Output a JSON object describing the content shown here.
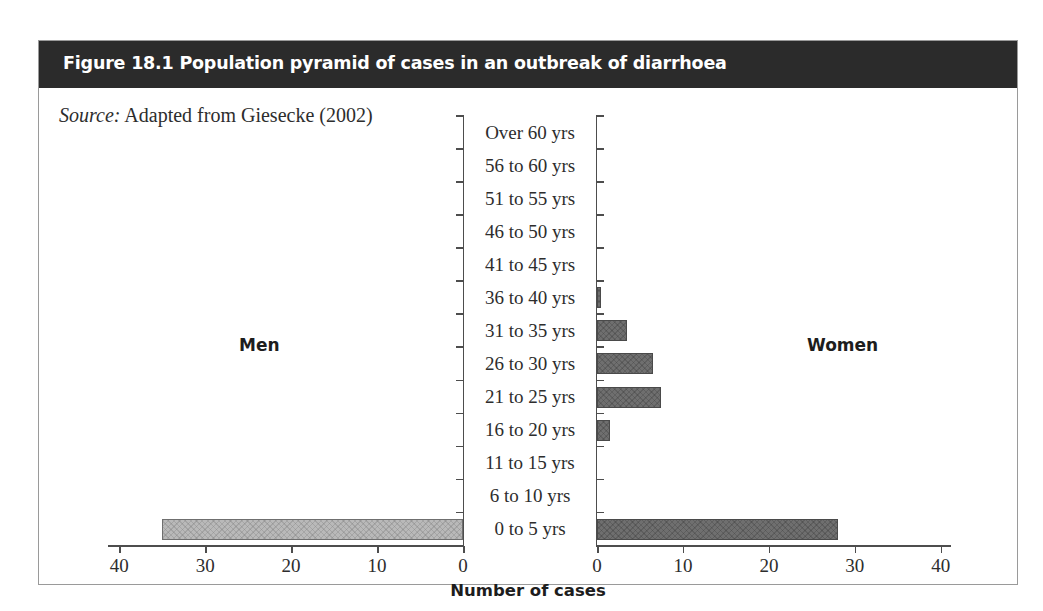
{
  "figure": {
    "title": "Figure 18.1 Population pyramid of cases in an outbreak of diarrhoea",
    "source_label": "Source:",
    "source_text": " Adapted from Giesecke (2002)",
    "header_color": "#2b2b2b",
    "border_color": "#9a9a9a"
  },
  "chart_data": {
    "type": "bar",
    "title": "Figure 18.1 Population pyramid of cases in an outbreak of diarrhoea",
    "subtitle": "Source: Adapted from Giesecke (2002)",
    "orientation": "horizontal-pyramid",
    "xlabel": "Number of cases",
    "ylabel": "",
    "xlim": [
      0,
      40
    ],
    "grid": false,
    "legend_position": "inline-panel",
    "left_series_label": "Men",
    "right_series_label": "Women",
    "left_color": "#b9b9b9",
    "right_color": "#6f6f6f",
    "categories": [
      "Over 60 yrs",
      "56 to 60 yrs",
      "51 to 55 yrs",
      "46 to 50 yrs",
      "41 to 45 yrs",
      "36 to 40 yrs",
      "31 to 35 yrs",
      "26 to 30 yrs",
      "21 to 25 yrs",
      "16 to 20 yrs",
      "11 to 15 yrs",
      "6 to 10 yrs",
      "0 to 5 yrs"
    ],
    "series": [
      {
        "name": "Men",
        "side": "left",
        "values": [
          0,
          0,
          0,
          0,
          0,
          0,
          0,
          0,
          0,
          0,
          0,
          0,
          35
        ]
      },
      {
        "name": "Women",
        "side": "right",
        "values": [
          0,
          0,
          0,
          0,
          0,
          0.5,
          3.5,
          6.5,
          7.5,
          1.5,
          0,
          0,
          28
        ]
      }
    ],
    "left_axis_ticks": [
      40,
      30,
      20,
      10,
      0
    ],
    "right_axis_ticks": [
      0,
      10,
      20,
      30,
      40
    ]
  }
}
